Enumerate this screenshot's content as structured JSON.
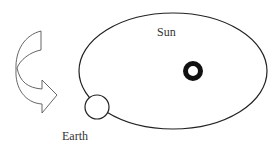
{
  "diagram": {
    "labels": {
      "sun": "Sun",
      "earth": "Earth"
    },
    "elements": [
      "orbit-ellipse",
      "sun",
      "earth",
      "direction-arrow"
    ],
    "colors": {
      "stroke": "#222222",
      "background": "#ffffff"
    }
  }
}
